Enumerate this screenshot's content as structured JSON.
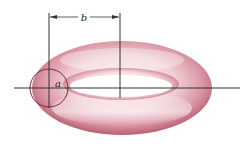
{
  "diagram": {
    "labels": {
      "major_radius": "b",
      "minor_radius": "a"
    },
    "colors": {
      "torus_light": "#f7e4e8",
      "torus_mid": "#e3a6b1",
      "torus_dark": "#b85c6e",
      "lines": "#333333",
      "background": "#ffffff"
    }
  }
}
